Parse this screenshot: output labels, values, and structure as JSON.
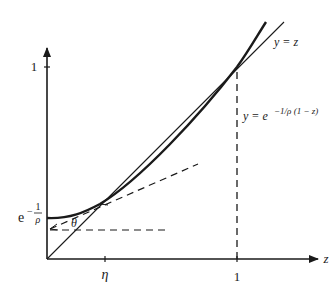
{
  "diagram": {
    "axes": {
      "x_label": "z",
      "y_label": "",
      "x_ticks": [
        {
          "label": "η",
          "value": "eta"
        },
        {
          "label": "1",
          "value": 1
        }
      ],
      "y_ticks": [
        {
          "label": "1",
          "value": 1
        }
      ]
    },
    "y_intercept_label": {
      "base": "e",
      "minus": "−",
      "frac_num": "1",
      "frac_den": "ρ"
    },
    "curves": [
      {
        "name": "identity-line",
        "label": "y = z"
      },
      {
        "name": "exponential-curve",
        "label": "y = e",
        "label_exp": "−1/ρ (1 − z)"
      }
    ],
    "angle_label": "θ",
    "colors": {
      "stroke": "#1a1a1a",
      "background": "#ffffff"
    }
  }
}
